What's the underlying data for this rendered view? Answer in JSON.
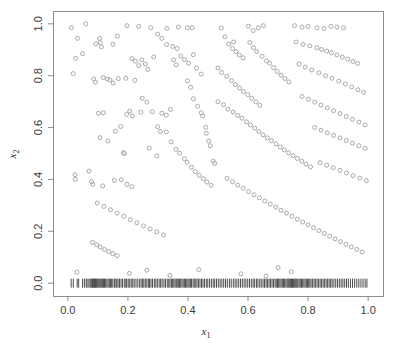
{
  "chart_data": {
    "type": "scatter",
    "title": "",
    "xlabel": "x1",
    "ylabel": "x2",
    "xlabel_base": "x",
    "xlabel_sub": "1",
    "ylabel_base": "x",
    "ylabel_sub": "2",
    "xlim": [
      0.0,
      1.0
    ],
    "ylim": [
      0.0,
      1.0
    ],
    "xticks": [
      0.0,
      0.2,
      0.4,
      0.6,
      0.8,
      1.0
    ],
    "yticks": [
      0.0,
      0.2,
      0.4,
      0.6,
      0.8,
      1.0
    ],
    "xtick_labels": [
      "0.0",
      "0.2",
      "0.4",
      "0.6",
      "0.8",
      "1.0"
    ],
    "ytick_labels": [
      "0.0",
      "0.2",
      "0.4",
      "0.6",
      "0.8",
      "1.0"
    ],
    "grid": false,
    "legend": false,
    "marker": "open-circle",
    "marker_size": 4,
    "point_color": "#a9a9a9",
    "frame_color": "#8c8c8c",
    "rug_color": "#4a4a4a",
    "n_points": 248,
    "rug_axis": "x",
    "rug_y": 0.0,
    "points": [
      [
        0.012,
        0.985
      ],
      [
        0.06,
        1.0
      ],
      [
        0.032,
        0.944
      ],
      [
        0.049,
        0.885
      ],
      [
        0.026,
        0.867
      ],
      [
        0.018,
        0.808
      ],
      [
        0.093,
        0.923
      ],
      [
        0.106,
        0.944
      ],
      [
        0.108,
        0.927
      ],
      [
        0.112,
        0.911
      ],
      [
        0.165,
        0.952
      ],
      [
        0.15,
        0.921
      ],
      [
        0.197,
        0.993
      ],
      [
        0.236,
        0.99
      ],
      [
        0.276,
        0.985
      ],
      [
        0.299,
        0.96
      ],
      [
        0.313,
        0.944
      ],
      [
        0.33,
        0.982
      ],
      [
        0.368,
        0.988
      ],
      [
        0.398,
        0.985
      ],
      [
        0.414,
        0.985
      ],
      [
        0.086,
        0.787
      ],
      [
        0.092,
        0.775
      ],
      [
        0.118,
        0.793
      ],
      [
        0.131,
        0.787
      ],
      [
        0.14,
        0.784
      ],
      [
        0.151,
        0.772
      ],
      [
        0.168,
        0.789
      ],
      [
        0.193,
        0.79
      ],
      [
        0.213,
        0.866
      ],
      [
        0.225,
        0.856
      ],
      [
        0.236,
        0.839
      ],
      [
        0.246,
        0.861
      ],
      [
        0.258,
        0.845
      ],
      [
        0.266,
        0.824
      ],
      [
        0.286,
        0.872
      ],
      [
        0.223,
        0.782
      ],
      [
        0.248,
        0.713
      ],
      [
        0.206,
        0.663
      ],
      [
        0.196,
        0.651
      ],
      [
        0.215,
        0.645
      ],
      [
        0.243,
        0.659
      ],
      [
        0.263,
        0.698
      ],
      [
        0.281,
        0.661
      ],
      [
        0.102,
        0.655
      ],
      [
        0.118,
        0.657
      ],
      [
        0.107,
        0.561
      ],
      [
        0.133,
        0.548
      ],
      [
        0.158,
        0.586
      ],
      [
        0.176,
        0.604
      ],
      [
        0.185,
        0.503
      ],
      [
        0.188,
        0.5
      ],
      [
        0.271,
        0.52
      ],
      [
        0.296,
        0.491
      ],
      [
        0.024,
        0.418
      ],
      [
        0.025,
        0.4
      ],
      [
        0.07,
        0.432
      ],
      [
        0.079,
        0.391
      ],
      [
        0.083,
        0.381
      ],
      [
        0.116,
        0.375
      ],
      [
        0.155,
        0.396
      ],
      [
        0.178,
        0.399
      ],
      [
        0.197,
        0.381
      ],
      [
        0.213,
        0.372
      ],
      [
        0.329,
        0.92
      ],
      [
        0.349,
        0.913
      ],
      [
        0.364,
        0.905
      ],
      [
        0.352,
        0.861
      ],
      [
        0.361,
        0.842
      ],
      [
        0.376,
        0.876
      ],
      [
        0.389,
        0.862
      ],
      [
        0.402,
        0.848
      ],
      [
        0.418,
        0.881
      ],
      [
        0.428,
        0.829
      ],
      [
        0.444,
        0.806
      ],
      [
        0.398,
        0.78
      ],
      [
        0.409,
        0.755
      ],
      [
        0.418,
        0.711
      ],
      [
        0.432,
        0.682
      ],
      [
        0.444,
        0.657
      ],
      [
        0.449,
        0.645
      ],
      [
        0.459,
        0.601
      ],
      [
        0.461,
        0.578
      ],
      [
        0.469,
        0.548
      ],
      [
        0.474,
        0.53
      ],
      [
        0.484,
        0.471
      ],
      [
        0.489,
        0.462
      ],
      [
        0.313,
        0.655
      ],
      [
        0.328,
        0.648
      ],
      [
        0.342,
        0.67
      ],
      [
        0.299,
        0.603
      ],
      [
        0.308,
        0.585
      ],
      [
        0.328,
        0.583
      ],
      [
        0.344,
        0.545
      ],
      [
        0.36,
        0.516
      ],
      [
        0.372,
        0.501
      ],
      [
        0.388,
        0.48
      ],
      [
        0.397,
        0.466
      ],
      [
        0.412,
        0.447
      ],
      [
        0.424,
        0.43
      ],
      [
        0.437,
        0.416
      ],
      [
        0.451,
        0.403
      ],
      [
        0.463,
        0.39
      ],
      [
        0.477,
        0.377
      ],
      [
        0.511,
        0.984
      ],
      [
        0.523,
        0.95
      ],
      [
        0.536,
        0.922
      ],
      [
        0.552,
        0.93
      ],
      [
        0.548,
        0.905
      ],
      [
        0.56,
        0.893
      ],
      [
        0.571,
        0.88
      ],
      [
        0.584,
        0.869
      ],
      [
        0.601,
        0.991
      ],
      [
        0.617,
        0.974
      ],
      [
        0.634,
        0.985
      ],
      [
        0.651,
        0.993
      ],
      [
        0.606,
        0.928
      ],
      [
        0.618,
        0.908
      ],
      [
        0.629,
        0.893
      ],
      [
        0.647,
        0.875
      ],
      [
        0.662,
        0.857
      ],
      [
        0.672,
        0.848
      ],
      [
        0.685,
        0.831
      ],
      [
        0.697,
        0.816
      ],
      [
        0.71,
        0.802
      ],
      [
        0.723,
        0.789
      ],
      [
        0.736,
        0.776
      ],
      [
        0.5,
        0.83
      ],
      [
        0.512,
        0.812
      ],
      [
        0.529,
        0.798
      ],
      [
        0.545,
        0.781
      ],
      [
        0.558,
        0.766
      ],
      [
        0.572,
        0.753
      ],
      [
        0.585,
        0.739
      ],
      [
        0.599,
        0.727
      ],
      [
        0.612,
        0.713
      ],
      [
        0.626,
        0.699
      ],
      [
        0.639,
        0.686
      ],
      [
        0.5,
        0.7
      ],
      [
        0.518,
        0.688
      ],
      [
        0.533,
        0.671
      ],
      [
        0.55,
        0.66
      ],
      [
        0.566,
        0.647
      ],
      [
        0.58,
        0.636
      ],
      [
        0.595,
        0.622
      ],
      [
        0.608,
        0.61
      ],
      [
        0.622,
        0.598
      ],
      [
        0.636,
        0.585
      ],
      [
        0.65,
        0.572
      ],
      [
        0.664,
        0.56
      ],
      [
        0.678,
        0.549
      ],
      [
        0.693,
        0.537
      ],
      [
        0.707,
        0.525
      ],
      [
        0.721,
        0.514
      ],
      [
        0.735,
        0.503
      ],
      [
        0.75,
        0.492
      ],
      [
        0.764,
        0.481
      ],
      [
        0.779,
        0.47
      ],
      [
        0.793,
        0.459
      ],
      [
        0.808,
        0.448
      ],
      [
        0.755,
        0.993
      ],
      [
        0.78,
        0.987
      ],
      [
        0.8,
        0.99
      ],
      [
        0.83,
        0.985
      ],
      [
        0.853,
        0.982
      ],
      [
        0.876,
        0.99
      ],
      [
        0.896,
        0.987
      ],
      [
        0.918,
        0.985
      ],
      [
        0.76,
        0.93
      ],
      [
        0.783,
        0.921
      ],
      [
        0.806,
        0.915
      ],
      [
        0.829,
        0.908
      ],
      [
        0.845,
        0.901
      ],
      [
        0.862,
        0.895
      ],
      [
        0.878,
        0.888
      ],
      [
        0.896,
        0.88
      ],
      [
        0.914,
        0.872
      ],
      [
        0.932,
        0.864
      ],
      [
        0.949,
        0.855
      ],
      [
        0.965,
        0.847
      ],
      [
        0.77,
        0.845
      ],
      [
        0.79,
        0.833
      ],
      [
        0.812,
        0.822
      ],
      [
        0.836,
        0.811
      ],
      [
        0.858,
        0.8
      ],
      [
        0.88,
        0.79
      ],
      [
        0.902,
        0.779
      ],
      [
        0.924,
        0.768
      ],
      [
        0.945,
        0.757
      ],
      [
        0.966,
        0.746
      ],
      [
        0.985,
        0.736
      ],
      [
        0.78,
        0.72
      ],
      [
        0.801,
        0.709
      ],
      [
        0.822,
        0.698
      ],
      [
        0.843,
        0.687
      ],
      [
        0.864,
        0.676
      ],
      [
        0.885,
        0.665
      ],
      [
        0.906,
        0.654
      ],
      [
        0.927,
        0.643
      ],
      [
        0.948,
        0.632
      ],
      [
        0.969,
        0.621
      ],
      [
        0.99,
        0.61
      ],
      [
        0.822,
        0.6
      ],
      [
        0.843,
        0.59
      ],
      [
        0.864,
        0.58
      ],
      [
        0.885,
        0.57
      ],
      [
        0.906,
        0.56
      ],
      [
        0.927,
        0.55
      ],
      [
        0.948,
        0.54
      ],
      [
        0.969,
        0.53
      ],
      [
        0.99,
        0.52
      ],
      [
        0.84,
        0.465
      ],
      [
        0.862,
        0.455
      ],
      [
        0.884,
        0.445
      ],
      [
        0.906,
        0.435
      ],
      [
        0.928,
        0.425
      ],
      [
        0.95,
        0.415
      ],
      [
        0.972,
        0.405
      ],
      [
        0.994,
        0.395
      ],
      [
        0.53,
        0.404
      ],
      [
        0.548,
        0.391
      ],
      [
        0.566,
        0.378
      ],
      [
        0.584,
        0.366
      ],
      [
        0.602,
        0.353
      ],
      [
        0.62,
        0.341
      ],
      [
        0.638,
        0.329
      ],
      [
        0.656,
        0.317
      ],
      [
        0.674,
        0.305
      ],
      [
        0.692,
        0.293
      ],
      [
        0.71,
        0.281
      ],
      [
        0.728,
        0.27
      ],
      [
        0.746,
        0.258
      ],
      [
        0.764,
        0.247
      ],
      [
        0.782,
        0.236
      ],
      [
        0.8,
        0.225
      ],
      [
        0.818,
        0.214
      ],
      [
        0.836,
        0.203
      ],
      [
        0.854,
        0.192
      ],
      [
        0.872,
        0.181
      ],
      [
        0.89,
        0.171
      ],
      [
        0.908,
        0.16
      ],
      [
        0.926,
        0.15
      ],
      [
        0.944,
        0.14
      ],
      [
        0.962,
        0.13
      ],
      [
        0.98,
        0.12
      ],
      [
        0.098,
        0.309
      ],
      [
        0.12,
        0.296
      ],
      [
        0.142,
        0.283
      ],
      [
        0.164,
        0.27
      ],
      [
        0.186,
        0.258
      ],
      [
        0.208,
        0.245
      ],
      [
        0.23,
        0.233
      ],
      [
        0.252,
        0.221
      ],
      [
        0.274,
        0.209
      ],
      [
        0.296,
        0.198
      ],
      [
        0.318,
        0.186
      ],
      [
        0.082,
        0.157
      ],
      [
        0.096,
        0.148
      ],
      [
        0.108,
        0.139
      ],
      [
        0.122,
        0.13
      ],
      [
        0.136,
        0.122
      ],
      [
        0.15,
        0.114
      ],
      [
        0.164,
        0.106
      ],
      [
        0.03,
        0.042
      ],
      [
        0.205,
        0.038
      ],
      [
        0.263,
        0.05
      ],
      [
        0.34,
        0.03
      ],
      [
        0.436,
        0.052
      ],
      [
        0.576,
        0.036
      ],
      [
        0.66,
        0.028
      ],
      [
        0.7,
        0.06
      ],
      [
        0.744,
        0.044
      ]
    ],
    "rug_values": [
      0.011,
      0.018,
      0.031,
      0.036,
      0.049,
      0.055,
      0.061,
      0.064,
      0.07,
      0.074,
      0.077,
      0.08,
      0.082,
      0.084,
      0.086,
      0.088,
      0.09,
      0.092,
      0.095,
      0.098,
      0.101,
      0.104,
      0.107,
      0.11,
      0.113,
      0.116,
      0.119,
      0.122,
      0.126,
      0.13,
      0.134,
      0.138,
      0.142,
      0.146,
      0.15,
      0.155,
      0.16,
      0.163,
      0.167,
      0.172,
      0.177,
      0.182,
      0.188,
      0.193,
      0.196,
      0.201,
      0.206,
      0.211,
      0.216,
      0.221,
      0.227,
      0.233,
      0.239,
      0.244,
      0.249,
      0.253,
      0.258,
      0.263,
      0.268,
      0.272,
      0.277,
      0.282,
      0.288,
      0.293,
      0.298,
      0.304,
      0.309,
      0.314,
      0.32,
      0.325,
      0.331,
      0.336,
      0.34,
      0.345,
      0.349,
      0.353,
      0.357,
      0.361,
      0.364,
      0.368,
      0.372,
      0.376,
      0.38,
      0.384,
      0.388,
      0.392,
      0.396,
      0.4,
      0.404,
      0.408,
      0.412,
      0.417,
      0.421,
      0.426,
      0.43,
      0.435,
      0.44,
      0.445,
      0.45,
      0.455,
      0.461,
      0.466,
      0.472,
      0.478,
      0.484,
      0.489,
      0.495,
      0.501,
      0.507,
      0.513,
      0.519,
      0.525,
      0.531,
      0.538,
      0.544,
      0.551,
      0.557,
      0.563,
      0.569,
      0.575,
      0.581,
      0.587,
      0.593,
      0.599,
      0.605,
      0.611,
      0.617,
      0.622,
      0.628,
      0.633,
      0.639,
      0.644,
      0.65,
      0.655,
      0.66,
      0.665,
      0.67,
      0.675,
      0.68,
      0.685,
      0.69,
      0.694,
      0.698,
      0.702,
      0.706,
      0.71,
      0.714,
      0.718,
      0.722,
      0.726,
      0.73,
      0.733,
      0.736,
      0.739,
      0.742,
      0.745,
      0.748,
      0.751,
      0.754,
      0.757,
      0.76,
      0.763,
      0.766,
      0.77,
      0.774,
      0.778,
      0.782,
      0.786,
      0.79,
      0.794,
      0.798,
      0.802,
      0.806,
      0.81,
      0.815,
      0.82,
      0.825,
      0.83,
      0.835,
      0.84,
      0.845,
      0.85,
      0.855,
      0.86,
      0.865,
      0.87,
      0.875,
      0.88,
      0.886,
      0.892,
      0.898,
      0.904,
      0.91,
      0.916,
      0.922,
      0.928,
      0.934,
      0.941,
      0.948,
      0.955,
      0.962,
      0.969,
      0.976,
      0.983,
      0.99,
      0.996
    ]
  },
  "figure": {
    "background_color": "#ffffff",
    "plot_area": {
      "left_px": 53,
      "right_px": 383,
      "top_px": 11,
      "bottom_px": 296
    }
  }
}
